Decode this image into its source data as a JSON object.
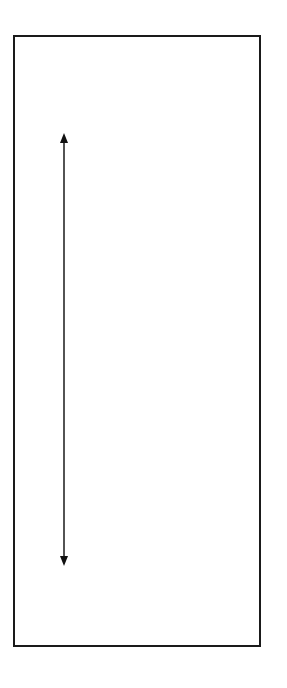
{
  "diagram": {
    "frame": {
      "stroke": "#1a1a1a"
    },
    "arrow": {
      "type": "double-headed-vertical",
      "color": "#1a1a1a"
    }
  }
}
